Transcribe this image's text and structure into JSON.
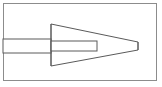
{
  "figure": {
    "canvas": {
      "width": 162,
      "height": 87,
      "background_color": "#ffffff"
    },
    "style": {
      "line_color": "#5a5a5a",
      "frame_color": "#8c8c8c",
      "fill_color": "#ffffff",
      "stroke_width": 1
    },
    "frame": {
      "name": "border-frame",
      "x": 3,
      "y": 3,
      "width": 154,
      "height": 78
    },
    "shapes": [
      {
        "name": "shaft",
        "kind": "rectangle",
        "x": 3,
        "y": 39,
        "width": 48,
        "height": 14,
        "label": "Shaft"
      },
      {
        "name": "cone",
        "kind": "polygon",
        "points": "51,24 138,42 138,50 51,66",
        "label": "Truncated Cone"
      },
      {
        "name": "inner-bore",
        "kind": "rectangle",
        "x": 51,
        "y": 41,
        "width": 46,
        "height": 10,
        "label": "Inner Bore"
      }
    ]
  }
}
